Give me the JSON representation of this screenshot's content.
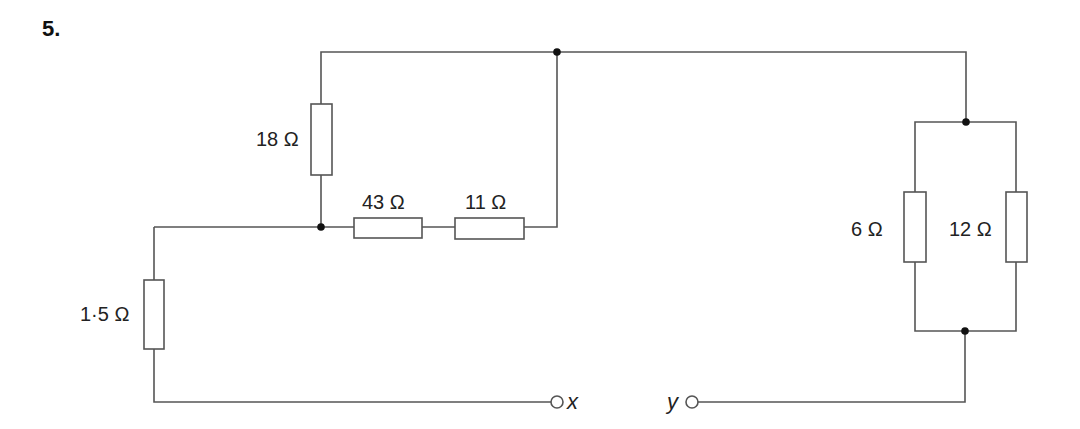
{
  "question": {
    "number": "5."
  },
  "diagram": {
    "type": "circuit",
    "resistors": [
      {
        "id": "r18",
        "label": "18 Ω",
        "value_ohms": 18
      },
      {
        "id": "r43",
        "label": "43 Ω",
        "value_ohms": 43
      },
      {
        "id": "r11",
        "label": "11 Ω",
        "value_ohms": 11
      },
      {
        "id": "r1_5",
        "label": "1·5 Ω",
        "value_ohms": 1.5
      },
      {
        "id": "r6",
        "label": "6 Ω",
        "value_ohms": 6
      },
      {
        "id": "r12",
        "label": "12 Ω",
        "value_ohms": 12
      }
    ],
    "terminals": [
      {
        "id": "x",
        "label": "x"
      },
      {
        "id": "y",
        "label": "y"
      }
    ]
  }
}
